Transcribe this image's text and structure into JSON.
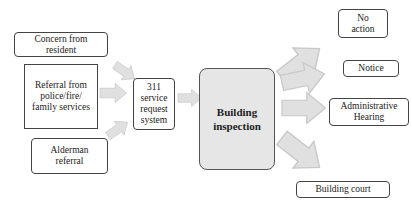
{
  "diagram": {
    "type": "flowchart",
    "inputs": [
      {
        "id": "concern",
        "label": "Concern from\nresident"
      },
      {
        "id": "referral",
        "label": "Referral from\npolice/fire/\nfamily services"
      },
      {
        "id": "alderman",
        "label": "Alderman\nreferral"
      }
    ],
    "intake": {
      "label": "311\nservice\nrequest\nsystem"
    },
    "process": {
      "label": "Building\ninspection"
    },
    "outcomes": [
      {
        "id": "no-action",
        "label": "No\naction"
      },
      {
        "id": "notice",
        "label": "Notice"
      },
      {
        "id": "admin-hearing",
        "label": "Administrative\nHearing"
      },
      {
        "id": "building-court",
        "label": "Building court"
      }
    ],
    "colors": {
      "arrow_fill": "#e0e0e0",
      "arrow_stroke": "#c8c8c8",
      "process_fill": "#e6e6e6",
      "border": "#444444"
    }
  }
}
